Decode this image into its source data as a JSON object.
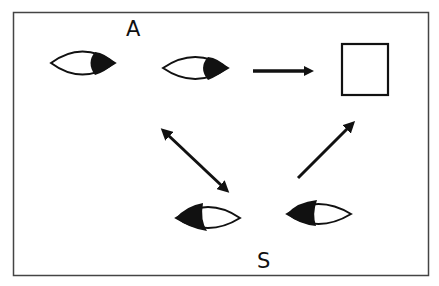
{
  "diagram": {
    "type": "joint-attention illustration",
    "labels": {
      "top_agent": "A",
      "bottom_agent": "S"
    },
    "agents": [
      {
        "id": "A",
        "eyes": 2,
        "gaze_direction": "right",
        "description": "pair of eyes looking right"
      },
      {
        "id": "S",
        "eyes": 2,
        "gaze_direction": "left",
        "description": "pair of eyes looking up-left"
      }
    ],
    "object": {
      "shape": "square",
      "description": "target object"
    },
    "arrows": [
      {
        "from": "A",
        "to": "object",
        "style": "single-headed",
        "direction": "horizontal"
      },
      {
        "from": "A",
        "to": "S",
        "style": "double-headed",
        "direction": "diagonal"
      },
      {
        "from": "S",
        "to": "object",
        "style": "single-headed",
        "direction": "diagonal"
      }
    ],
    "colors": {
      "stroke": "#111111",
      "background": "#ffffff",
      "frame": "#444444"
    }
  }
}
